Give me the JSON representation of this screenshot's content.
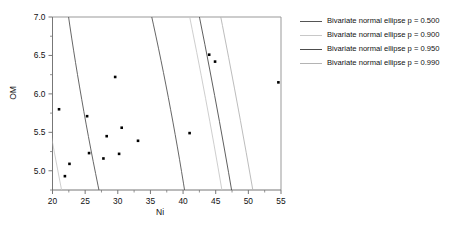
{
  "chart_data": {
    "type": "scatter",
    "title": "",
    "xlabel": "Ni",
    "ylabel": "OM",
    "xlim": [
      20,
      55
    ],
    "ylim": [
      4.75,
      7.0
    ],
    "xticks": [
      20,
      25,
      30,
      35,
      40,
      45,
      50,
      55
    ],
    "yticks": [
      5.0,
      5.5,
      6.0,
      6.5,
      7.0
    ],
    "xtick_labels": [
      "20",
      "25",
      "30",
      "35",
      "40",
      "45",
      "50",
      "55"
    ],
    "ytick_labels": [
      "5.0",
      "5.5",
      "6.0",
      "6.5",
      "7.0"
    ],
    "grid": false,
    "minor_ticks": true,
    "points": [
      {
        "x": 21.0,
        "y": 5.8
      },
      {
        "x": 21.9,
        "y": 4.93
      },
      {
        "x": 22.6,
        "y": 5.09
      },
      {
        "x": 25.3,
        "y": 5.71
      },
      {
        "x": 25.6,
        "y": 5.23
      },
      {
        "x": 27.8,
        "y": 5.16
      },
      {
        "x": 28.3,
        "y": 5.45
      },
      {
        "x": 29.6,
        "y": 6.22
      },
      {
        "x": 30.2,
        "y": 5.22
      },
      {
        "x": 30.6,
        "y": 5.56
      },
      {
        "x": 33.1,
        "y": 5.39
      },
      {
        "x": 41.0,
        "y": 5.49
      },
      {
        "x": 44.0,
        "y": 6.51
      },
      {
        "x": 44.9,
        "y": 6.42
      },
      {
        "x": 54.6,
        "y": 6.15
      }
    ],
    "ellipses": [
      {
        "p": 0.5,
        "label": "Bivariate normal ellipse p = 0.500",
        "color": "#555555",
        "cx": 31.8,
        "cy": 5.62,
        "rx": 12.6,
        "ry": 2.45,
        "angle": -18.5
      },
      {
        "p": 0.9,
        "label": "Bivariate normal ellipse p = 0.900",
        "color": "#c8c8c8",
        "cx": 31.8,
        "cy": 5.62,
        "rx": 23.3,
        "ry": 4.53,
        "angle": -18.5
      },
      {
        "p": 0.95,
        "label": "Bivariate normal ellipse p = 0.950",
        "color": "#4d4d4d",
        "cx": 31.8,
        "cy": 5.62,
        "rx": 26.1,
        "ry": 5.07,
        "angle": -18.5
      },
      {
        "p": 0.99,
        "label": "Bivariate normal ellipse p = 0.990",
        "color": "#b4b4b4",
        "cx": 31.8,
        "cy": 5.62,
        "rx": 32.2,
        "ry": 6.26,
        "angle": -18.5
      }
    ],
    "legend_position": "right",
    "marker": "square",
    "marker_color": "#000000",
    "axis_color": "#777777"
  },
  "legend": {
    "entries": [
      {
        "label": "Bivariate normal ellipse p = 0.500",
        "color": "#555555"
      },
      {
        "label": "Bivariate normal ellipse p = 0.900",
        "color": "#c8c8c8"
      },
      {
        "label": "Bivariate normal ellipse p = 0.950",
        "color": "#4d4d4d"
      },
      {
        "label": "Bivariate normal ellipse p = 0.990",
        "color": "#b4b4b4"
      }
    ]
  },
  "axes": {
    "y_title": "OM",
    "x_title": "Ni"
  }
}
